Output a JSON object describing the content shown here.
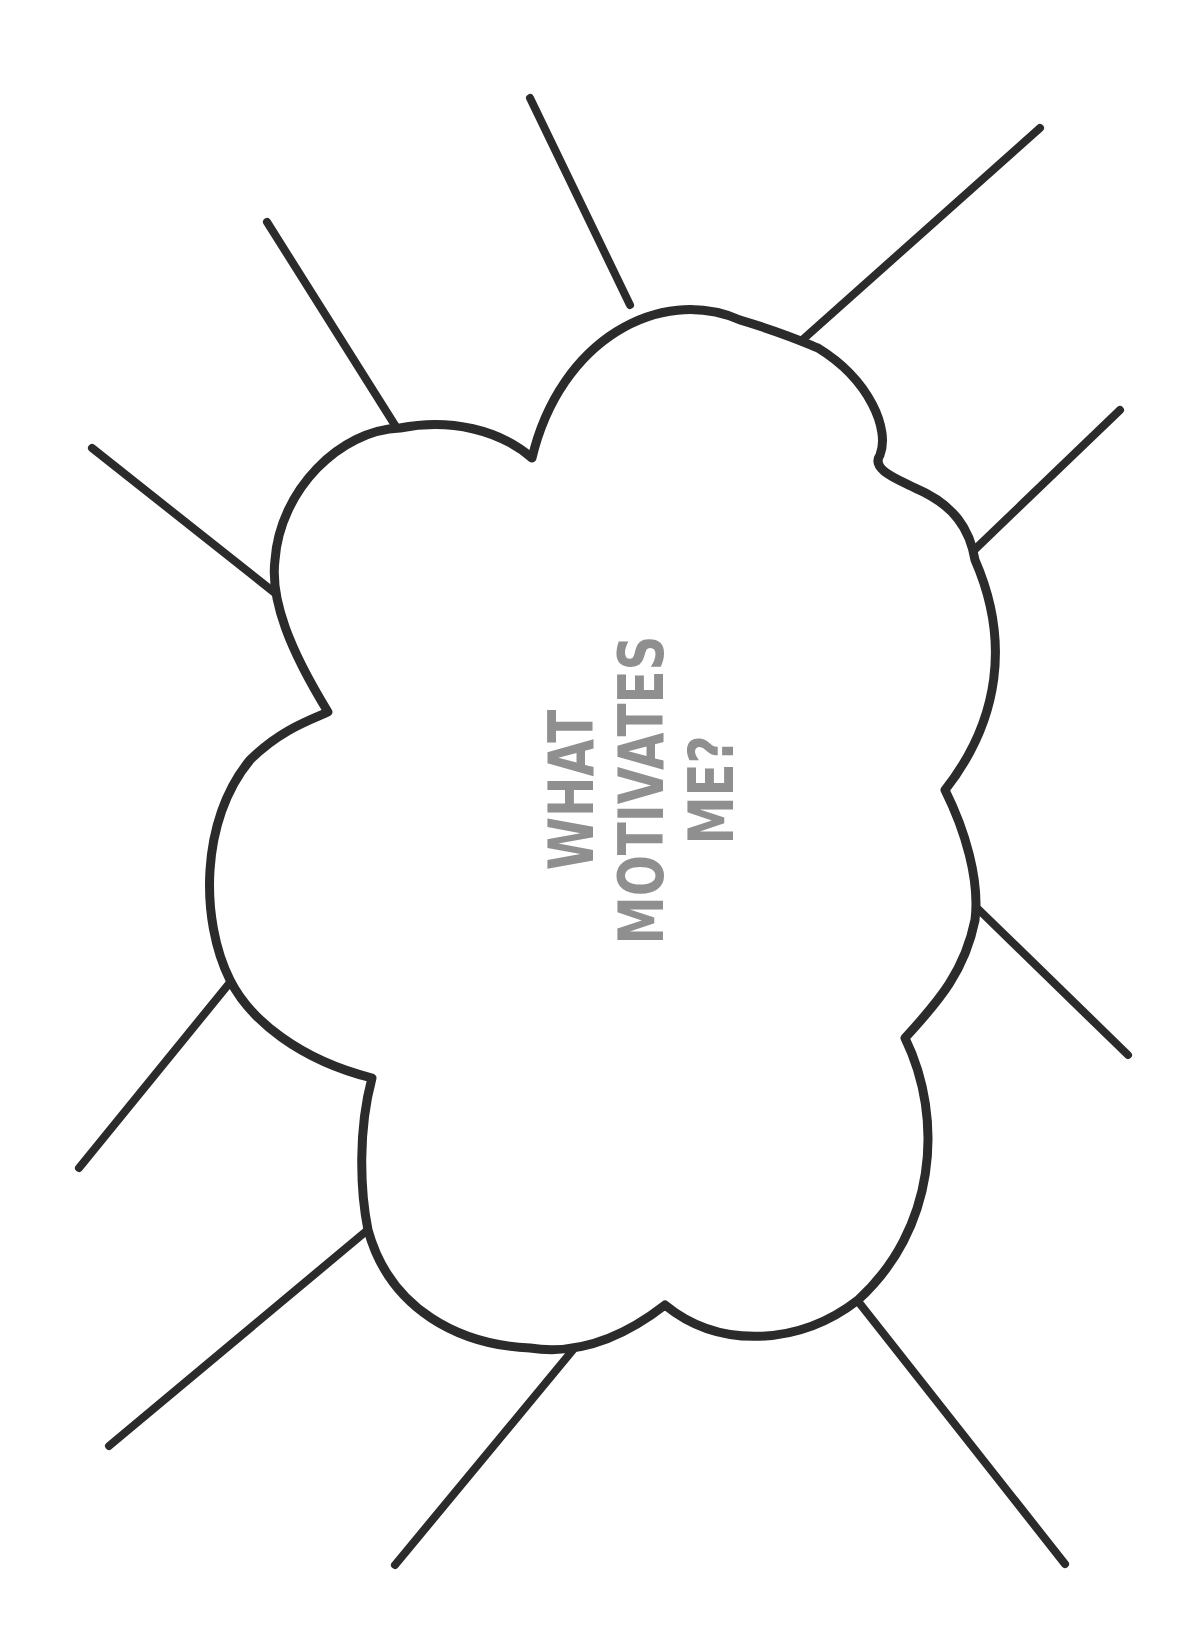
{
  "worksheet": {
    "title_lines": [
      "WHAT",
      "MOTIVATES",
      "ME?"
    ],
    "text_color": "#8f8f8f",
    "stroke_color": "#2b2b2b",
    "background": "#ffffff"
  },
  "rays": [
    {
      "x1": 530,
      "y1": 98,
      "x2": 630,
      "y2": 305
    },
    {
      "x1": 1040,
      "y1": 128,
      "x2": 800,
      "y2": 342
    },
    {
      "x1": 267,
      "y1": 222,
      "x2": 398,
      "y2": 430
    },
    {
      "x1": 1120,
      "y1": 410,
      "x2": 967,
      "y2": 557
    },
    {
      "x1": 92,
      "y1": 448,
      "x2": 275,
      "y2": 593
    },
    {
      "x1": 975,
      "y1": 906,
      "x2": 1128,
      "y2": 1055
    },
    {
      "x1": 232,
      "y1": 980,
      "x2": 79,
      "y2": 1168
    },
    {
      "x1": 370,
      "y1": 1228,
      "x2": 109,
      "y2": 1446
    },
    {
      "x1": 577,
      "y1": 1345,
      "x2": 395,
      "y2": 1565
    },
    {
      "x1": 857,
      "y1": 1300,
      "x2": 1065,
      "y2": 1564
    }
  ]
}
